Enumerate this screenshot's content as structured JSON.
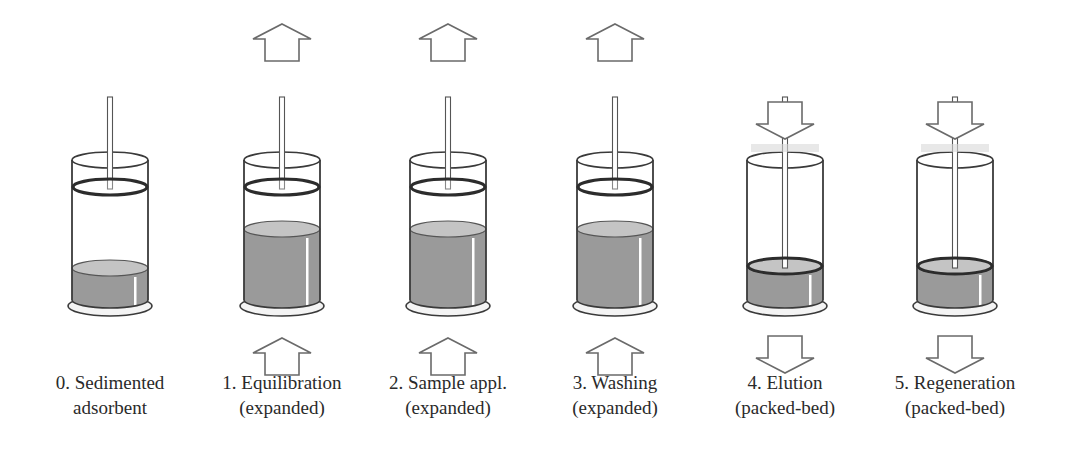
{
  "figure": {
    "steps": [
      {
        "number": "0",
        "line1": "0. Sedimented",
        "line2": "adsorbent",
        "state": "sedimented",
        "flow_top": "none",
        "flow_bottom": "none",
        "center_x": 110
      },
      {
        "number": "1",
        "line1": "1. Equilibration",
        "line2": "(expanded)",
        "state": "expanded",
        "flow_top": "up",
        "flow_bottom": "up",
        "center_x": 282
      },
      {
        "number": "2",
        "line1": "2. Sample appl.",
        "line2": "(expanded)",
        "state": "expanded",
        "flow_top": "up",
        "flow_bottom": "up",
        "center_x": 448
      },
      {
        "number": "3",
        "line1": "3. Washing",
        "line2": "(expanded)",
        "state": "expanded",
        "flow_top": "up",
        "flow_bottom": "up",
        "center_x": 615
      },
      {
        "number": "4",
        "line1": "4. Elution",
        "line2": "(packed-bed)",
        "state": "packed",
        "flow_top": "down",
        "flow_bottom": "down",
        "center_x": 785
      },
      {
        "number": "5",
        "line1": "5. Regeneration",
        "line2": "(packed-bed)",
        "state": "packed",
        "flow_top": "down",
        "flow_bottom": "down",
        "center_x": 955
      }
    ],
    "colors": {
      "bed_fill": "#9a9a9a",
      "bed_top": "#c4c4c4",
      "outline": "#3a3a3a",
      "arrow_outline": "#6a6a6a",
      "background": "#ffffff"
    }
  }
}
